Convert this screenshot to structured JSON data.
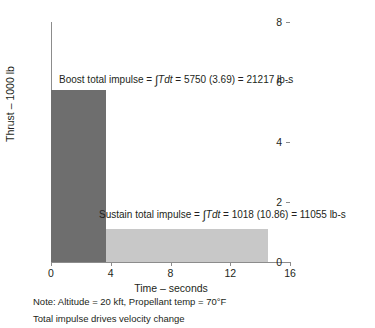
{
  "chart_data": {
    "type": "bar",
    "title": "",
    "subtitle": "",
    "xlabel": "Time – seconds",
    "ylabel": "Thrust – 1000 lb",
    "xlim": [
      0,
      16
    ],
    "ylim": [
      0,
      8
    ],
    "xticks": [
      "0",
      "4",
      "8",
      "12",
      "16"
    ],
    "xtick_values": [
      0,
      4,
      8,
      12,
      16
    ],
    "yticks": [
      "0",
      "2",
      "4",
      "6",
      "8"
    ],
    "ytick_values": [
      0,
      2,
      4,
      6,
      8
    ],
    "grid": false,
    "legend": "none",
    "series": [
      {
        "name": "Boost phase",
        "x_start": 0,
        "x_end": 3.69,
        "value": 5.75,
        "color": "#6e6e6e"
      },
      {
        "name": "Sustain phase",
        "x_start": 3.69,
        "x_end": 14.55,
        "value": 1.1,
        "color": "#c8c8c8"
      }
    ],
    "annotations": [
      {
        "name": "boost-total-impulse",
        "prefix": "Boost total impulse = ",
        "integral": "∫",
        "integrand": "Tdt",
        "suffix": " = 5750 (3.69) = 21217 lb-s"
      },
      {
        "name": "sustain-total-impulse",
        "prefix": "Sustain total impulse = ",
        "integral": "∫",
        "integrand": "Tdt",
        "suffix": " = 1018 (10.86) = 11055 lb-s"
      }
    ],
    "footnotes": [
      "Note: Altitude = 20 kft, Propellant temp  = 70°F",
      "Total impulse drives velocity change"
    ],
    "colors": {
      "boost": "#6e6e6e",
      "sustain": "#c8c8c8",
      "axis": "#8c8c8c",
      "text": "#231f20",
      "background": "#ffffff"
    }
  }
}
